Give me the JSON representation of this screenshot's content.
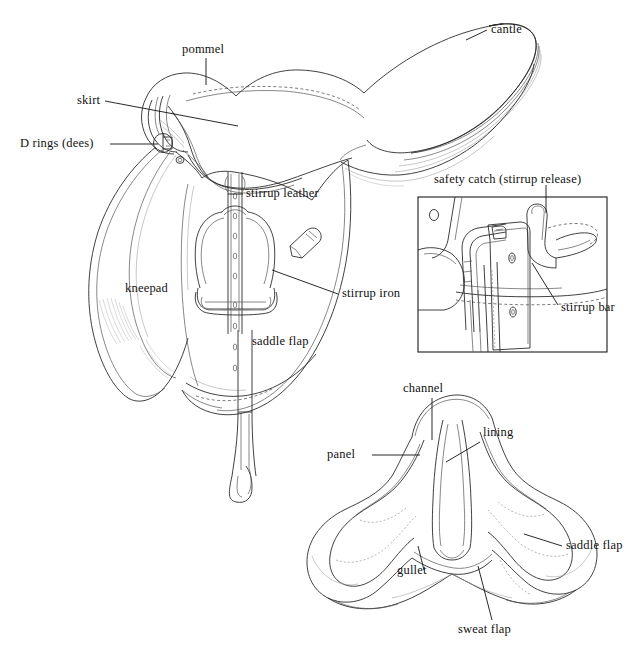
{
  "figure": {
    "background_color": "#ffffff",
    "ink_color": "#111111",
    "width": 642,
    "height": 655
  },
  "labels": {
    "pommel": "pommel",
    "cantle": "cantle",
    "skirt": "skirt",
    "d_rings": "D rings (dees)",
    "stirrup_leather": "stirrup leather",
    "stirrup_iron": "stirrup iron",
    "kneepad": "kneepad",
    "saddle_flap_main": "saddle flap",
    "safety_catch": "safety catch (stirrup release)",
    "stirrup_bar": "stirrup bar",
    "channel": "channel",
    "lining": "lining",
    "panel": "panel",
    "gullet": "gullet",
    "saddle_flap_under": "saddle flap",
    "sweat_flap": "sweat flap"
  },
  "views": {
    "main": "side view of English saddle",
    "inset": "detail view of stirrup bar and safety catch",
    "underside": "underside view of saddle panels"
  }
}
